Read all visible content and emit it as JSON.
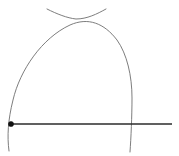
{
  "figure": {
    "background_color": "#ffffff",
    "canvas": {
      "width": 179,
      "height": 156
    },
    "colors": {
      "arc_stroke": "#6e6e6e",
      "baseline_stroke": "#2b2b2b",
      "point_fill": "#111111"
    },
    "points": [
      {
        "name": "center-point",
        "label": "",
        "x": 11,
        "y": 124
      },
      {
        "name": "baseline-right-intersection",
        "label": "",
        "x": 131,
        "y": 124
      },
      {
        "name": "arc-crossing-point",
        "label": "",
        "x": 75,
        "y": 18
      }
    ],
    "baseline": {
      "name": "horizontal-baseline",
      "x1": 11,
      "y1": 124,
      "x2": 172,
      "y2": 124
    },
    "arcs": [
      {
        "name": "major-arc",
        "description": "Large arc centered at left point, spanning from below the baseline on the left, over the apex, down through the baseline on the right",
        "path": "M 9 151 C 7 136 8 120 13 100 C 20 70 42 38 70 25 C 88 17 104 23 117 40 C 127 54 132 76 132 98 C 132 116 131 138 130 152",
        "apex_x": 78,
        "apex_y": 23
      },
      {
        "name": "minor-arc",
        "description": "Shallow downward-opening arc from upper left to upper right, crossing the major arc near the top",
        "path": "M 47 9 C 57 14 67 18 76 19 C 87 19 97 14 106 9",
        "start_x": 47,
        "start_y": 9,
        "end_x": 106,
        "end_y": 9
      }
    ]
  }
}
